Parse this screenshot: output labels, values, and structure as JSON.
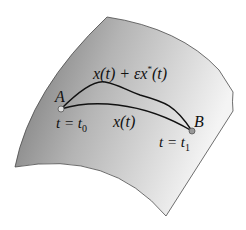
{
  "diagram": {
    "type": "variational-path-on-surface",
    "surface": {
      "fill_light": "#f2f2f2",
      "fill_dark": "#8a8a8a",
      "edge": "#4a4a4a"
    },
    "points": {
      "A": {
        "label": "A",
        "param": "t = t",
        "sub": "0"
      },
      "B": {
        "label": "B",
        "param": "t = t",
        "sub": "1"
      }
    },
    "curves": {
      "perturbed": {
        "label_main": "x(t) + εx",
        "label_sup": "*",
        "label_tail": "(t)"
      },
      "original": {
        "label": "x(t)"
      }
    },
    "curve_color": "#111111"
  }
}
